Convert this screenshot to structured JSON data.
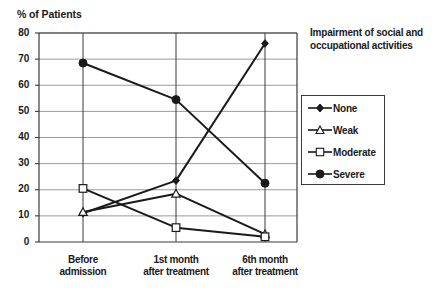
{
  "chart_data": {
    "type": "line",
    "title": "",
    "ylabel": "% of Patients",
    "xlabel": "",
    "categories": [
      "Before admission",
      "1st month after treatment",
      "6th month after treatment"
    ],
    "category_lines": [
      [
        "Before",
        "admission"
      ],
      [
        "1st month",
        "after treatment"
      ],
      [
        "6th month",
        "after treatment"
      ]
    ],
    "ylim": [
      0,
      80
    ],
    "yticks": [
      0,
      10,
      20,
      30,
      40,
      50,
      60,
      70,
      80
    ],
    "ytick_labels": [
      "0",
      "10",
      "20",
      "30",
      "40",
      "50",
      "60",
      "70",
      "80"
    ],
    "grid": true,
    "legend_position": "right",
    "legend_title": "Impairment of social and occupational activities",
    "legend_title_lines": [
      "Impairment of",
      "social and",
      "occupational activities"
    ],
    "series": [
      {
        "name": "None",
        "marker": "filled-diamond",
        "color": "#1a1a1a",
        "values": [
          11,
          23.5,
          76
        ]
      },
      {
        "name": "Weak",
        "marker": "open-triangle",
        "color": "#1a1a1a",
        "values": [
          11.5,
          18.5,
          3
        ]
      },
      {
        "name": "Moderate",
        "marker": "open-square",
        "color": "#1a1a1a",
        "values": [
          20.5,
          5.5,
          2
        ]
      },
      {
        "name": "Severe",
        "marker": "filled-circle",
        "color": "#1a1a1a",
        "values": [
          68.5,
          54.5,
          22.5
        ]
      }
    ]
  },
  "axis": {
    "ylabel": "% of Patients"
  },
  "legend": {
    "title_lines": [
      "Impairment of",
      "social and",
      "occupational activities"
    ],
    "items": [
      {
        "label": "None"
      },
      {
        "label": "Weak"
      },
      {
        "label": "Moderate"
      },
      {
        "label": "Severe"
      }
    ]
  }
}
